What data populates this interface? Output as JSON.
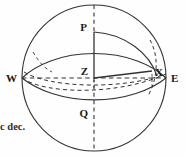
{
  "figure": {
    "kind": "celestial-sphere-diagram",
    "stroke_color": "#333333",
    "background_color": "#fefefe",
    "sphere": {
      "center_x": 94,
      "center_y": 78,
      "radius_x": 72,
      "radius_y": 73
    },
    "labels": {
      "pole": "P",
      "zenith": "Z",
      "star": "X",
      "west": "W",
      "east": "E",
      "lower_meridian_point": "Q"
    },
    "caption": {
      "text": "c dec.",
      "clipped": true
    },
    "line_styles": {
      "outline": "solid",
      "meridian_vertical": "dashed",
      "horizon_west_east": "dashed",
      "equator_back": "dashed",
      "equator_front": "dashed",
      "hour_circle": "dashed",
      "zenith_to_star": "solid",
      "pole_to_zenith": "solid",
      "upper_horizon_rim": "solid",
      "lower_horizon_rim": "solid",
      "meridian_arc_p_to_x": "solid"
    }
  }
}
